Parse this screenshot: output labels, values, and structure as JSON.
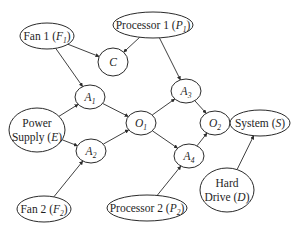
{
  "diagram": {
    "type": "bayesian-network",
    "nodes": [
      {
        "id": "F1",
        "label": "Fan 1 (",
        "var": "F",
        "sub": "1",
        "close": ")",
        "cx": 47,
        "cy": 36,
        "rx": 27,
        "ry": 13
      },
      {
        "id": "P1",
        "label": "Processor 1 (",
        "var": "P",
        "sub": "1",
        "close": ")",
        "cx": 153,
        "cy": 25,
        "rx": 40,
        "ry": 13
      },
      {
        "id": "C",
        "label": "",
        "var": "C",
        "sub": "",
        "close": "",
        "cx": 113,
        "cy": 62,
        "rx": 15,
        "ry": 14
      },
      {
        "id": "A1",
        "label": "",
        "var": "A",
        "sub": "1",
        "close": "",
        "cx": 90,
        "cy": 97,
        "rx": 15,
        "ry": 12
      },
      {
        "id": "E",
        "line1": "Power",
        "label": "Supply (",
        "var": "E",
        "sub": "",
        "close": ")",
        "cx": 37,
        "cy": 130,
        "rx": 28,
        "ry": 22
      },
      {
        "id": "A2",
        "label": "",
        "var": "A",
        "sub": "2",
        "close": "",
        "cx": 91,
        "cy": 151,
        "rx": 15,
        "ry": 12
      },
      {
        "id": "O1",
        "label": "",
        "var": "O",
        "sub": "1",
        "close": "",
        "cx": 141,
        "cy": 123,
        "rx": 15,
        "ry": 12
      },
      {
        "id": "A3",
        "label": "",
        "var": "A",
        "sub": "3",
        "close": "",
        "cx": 186,
        "cy": 91,
        "rx": 15,
        "ry": 12
      },
      {
        "id": "A4",
        "label": "",
        "var": "A",
        "sub": "4",
        "close": "",
        "cx": 189,
        "cy": 156,
        "rx": 15,
        "ry": 12
      },
      {
        "id": "O2",
        "label": "",
        "var": "O",
        "sub": "2",
        "close": "",
        "cx": 215,
        "cy": 123,
        "rx": 15,
        "ry": 12
      },
      {
        "id": "S",
        "label": "System (",
        "var": "S",
        "sub": "",
        "close": ")",
        "cx": 260,
        "cy": 123,
        "rx": 30,
        "ry": 13
      },
      {
        "id": "F2",
        "label": "Fan 2 (",
        "var": "F",
        "sub": "2",
        "close": ")",
        "cx": 44,
        "cy": 209,
        "rx": 27,
        "ry": 13
      },
      {
        "id": "P2",
        "label": "Processor 2 (",
        "var": "P",
        "sub": "2",
        "close": ")",
        "cx": 147,
        "cy": 208,
        "rx": 40,
        "ry": 13
      },
      {
        "id": "D",
        "line1": "Hard",
        "label": "Drive (",
        "var": "D",
        "sub": "",
        "close": ")",
        "cx": 227,
        "cy": 190,
        "rx": 27,
        "ry": 22
      }
    ],
    "edges": [
      [
        "F1",
        "C"
      ],
      [
        "P1",
        "C"
      ],
      [
        "F1",
        "A1"
      ],
      [
        "E",
        "A1"
      ],
      [
        "E",
        "A2"
      ],
      [
        "F2",
        "A2"
      ],
      [
        "A1",
        "O1"
      ],
      [
        "A2",
        "O1"
      ],
      [
        "P1",
        "A3"
      ],
      [
        "O1",
        "A3"
      ],
      [
        "O1",
        "A4"
      ],
      [
        "P2",
        "A4"
      ],
      [
        "A3",
        "O2"
      ],
      [
        "A4",
        "O2"
      ],
      [
        "O2",
        "S"
      ],
      [
        "D",
        "S"
      ]
    ]
  },
  "colors": {
    "stroke": "#2a2a2a",
    "text": "#1e1e1e",
    "background": "#ffffff"
  }
}
